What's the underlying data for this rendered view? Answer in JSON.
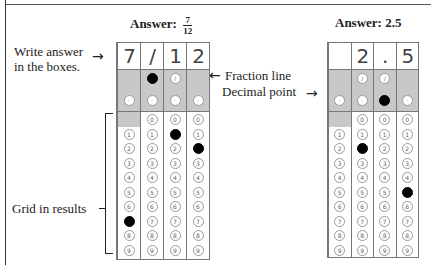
{
  "left_example": {
    "title_prefix": "Answer:",
    "fraction": {
      "numerator": "7",
      "denominator": "12"
    },
    "boxes": [
      "7",
      "/",
      "1",
      "2"
    ],
    "filled": {
      "slash": [
        1
      ],
      "decimal": [],
      "digits": {
        "0": 7,
        "2": 1,
        "3": 2
      }
    },
    "slash_cols": [
      1,
      2
    ],
    "zero_cols": [
      1,
      2,
      3
    ]
  },
  "right_example": {
    "title": "Answer: 2.5",
    "boxes": [
      "",
      "2",
      ".",
      "5"
    ],
    "filled": {
      "slash": [],
      "decimal": [
        2
      ],
      "digits": {
        "1": 2,
        "3": 5
      }
    },
    "slash_cols": [
      1,
      2
    ],
    "zero_cols": [
      1,
      2,
      3
    ]
  },
  "annotations": {
    "write_answer": "Write answer in the boxes.",
    "fraction_line": "Fraction line",
    "decimal_point": "Decimal point",
    "grid_results": "Grid in results"
  },
  "bubble_digits": [
    "0",
    "1",
    "2",
    "3",
    "4",
    "5",
    "6",
    "7",
    "8",
    "9"
  ],
  "symbols": {
    "slash": "∕",
    "decimal": "·"
  },
  "arrows": {
    "right": "→",
    "left": "←"
  }
}
